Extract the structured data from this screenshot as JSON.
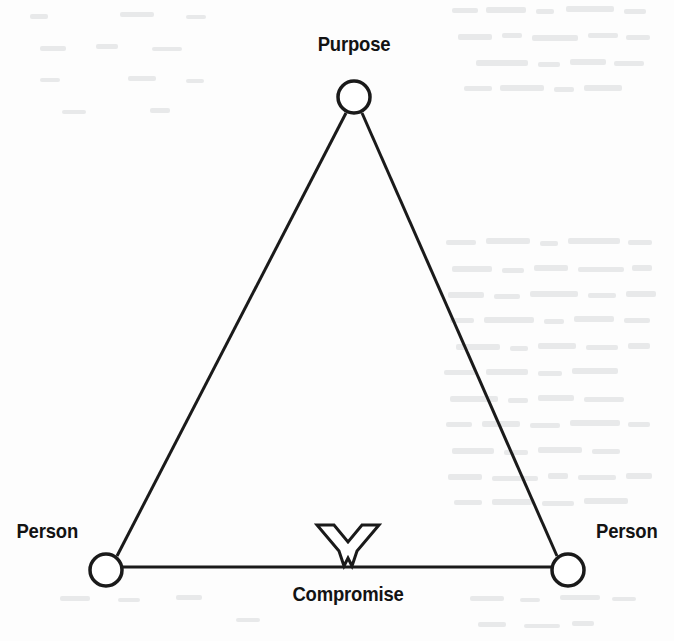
{
  "page": {
    "width": 674,
    "height": 641,
    "background_color": "#fdfdfd",
    "ink_color": "#1a1a1a",
    "text_color": "#131313"
  },
  "diagram": {
    "type": "triangle-relationship-diagram",
    "stroke_width": 3,
    "node_radius": 16,
    "nodes": [
      {
        "id": "purpose",
        "label": "Purpose",
        "x": 354,
        "y": 97,
        "label_position": "above"
      },
      {
        "id": "person-left",
        "label": "Person",
        "x": 106,
        "y": 570,
        "label_position": "left"
      },
      {
        "id": "person-right",
        "label": "Person",
        "x": 568,
        "y": 570,
        "label_position": "right"
      }
    ],
    "edges": [
      {
        "from": "person-left",
        "to": "purpose"
      },
      {
        "from": "purpose",
        "to": "person-right"
      },
      {
        "from": "person-left",
        "to": "person-right"
      }
    ],
    "markers": [
      {
        "id": "compromise",
        "glyph": "X",
        "label": "Compromise",
        "x": 348,
        "y": 548,
        "on_edge": "person-left--person-right",
        "style": "outlined-bold-x"
      }
    ]
  }
}
